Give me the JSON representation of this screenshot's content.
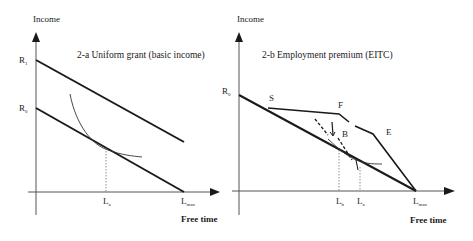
{
  "panel_a": {
    "title": "2-a Uniform grant (basic income)",
    "y_axis_label": "Income",
    "x_axis_label": "Free time",
    "r1": {
      "main": "R",
      "sub": "1"
    },
    "r0": {
      "main": "R",
      "sub": "0"
    },
    "la": {
      "main": "L",
      "sub": "a"
    },
    "lmax": {
      "main": "L",
      "sub": "max"
    }
  },
  "panel_b": {
    "title": "2-b Employment premium (EITC)",
    "y_axis_label": "Income",
    "x_axis_label": "Free time",
    "r0": {
      "main": "R",
      "sub": "0"
    },
    "point_s": "S",
    "point_f": "F",
    "point_b": "B",
    "point_e": "E",
    "lb": {
      "main": "L",
      "sub": "b"
    },
    "la": {
      "main": "L",
      "sub": "a"
    },
    "lmax": {
      "main": "L",
      "sub": "max"
    }
  },
  "colors": {
    "line": "#1a1a1a",
    "axis": "#555555",
    "guide": "#777777"
  }
}
